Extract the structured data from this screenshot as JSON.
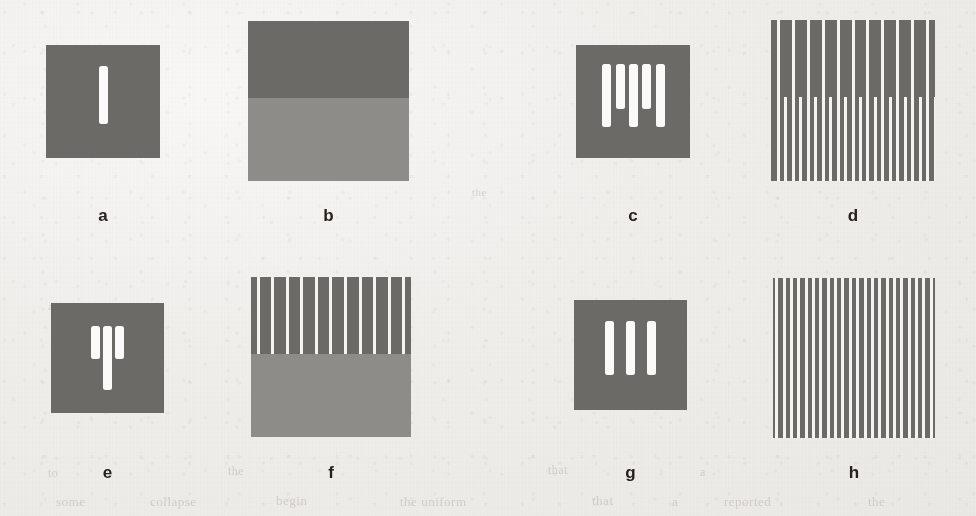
{
  "figure": {
    "caption_letters": [
      "a",
      "b",
      "c",
      "d",
      "e",
      "f",
      "g",
      "h"
    ],
    "background_color": "#f1f0ed",
    "dark_gray": "#6c6a67",
    "mid_gray": "#8e8c88",
    "line_white": "#f6f4f1",
    "label_color": "#26211d"
  },
  "panels": [
    {
      "id": "a",
      "label": "a",
      "type": "single-bar",
      "x": 46,
      "y": 45,
      "w": 114,
      "h": 113,
      "fill": "#6c6a67",
      "bars": [
        {
          "cx_pct": 50,
          "top_pct": 19,
          "h_pct": 51,
          "w": 9
        }
      ],
      "label_x": 46,
      "label_y": 206,
      "label_w": 114
    },
    {
      "id": "b",
      "label": "b",
      "type": "two-tone-field",
      "x": 248,
      "y": 21,
      "w": 161,
      "h": 160,
      "top_fill": "#6c6a67",
      "bottom_fill": "#8e8c88",
      "split_pct": 48,
      "label_x": 248,
      "label_y": 206,
      "label_w": 161
    },
    {
      "id": "c",
      "label": "c",
      "type": "bar-group",
      "x": 576,
      "y": 45,
      "w": 114,
      "h": 113,
      "fill": "#6c6a67",
      "bars": [
        {
          "cx_pct": 27,
          "top_pct": 17,
          "h_pct": 56,
          "w": 9
        },
        {
          "cx_pct": 39,
          "top_pct": 17,
          "h_pct": 40,
          "w": 9
        },
        {
          "cx_pct": 50,
          "top_pct": 17,
          "h_pct": 56,
          "w": 9
        },
        {
          "cx_pct": 62,
          "top_pct": 17,
          "h_pct": 40,
          "w": 9
        },
        {
          "cx_pct": 74,
          "top_pct": 17,
          "h_pct": 56,
          "w": 9
        }
      ],
      "label_x": 576,
      "label_y": 206,
      "label_w": 114
    },
    {
      "id": "d",
      "label": "d",
      "type": "grating-split-frequency",
      "x": 771,
      "y": 20,
      "w": 164,
      "h": 161,
      "fill": "#6c6a67",
      "full_lines": 11,
      "extra_lines": 11,
      "line_width": 3,
      "split_pct": 48,
      "label_x": 771,
      "label_y": 206,
      "label_w": 164
    },
    {
      "id": "e",
      "label": "e",
      "type": "bar-group",
      "x": 51,
      "y": 303,
      "w": 113,
      "h": 110,
      "fill": "#6c6a67",
      "bars": [
        {
          "cx_pct": 39,
          "top_pct": 21,
          "h_pct": 30,
          "w": 9
        },
        {
          "cx_pct": 50,
          "top_pct": 21,
          "h_pct": 58,
          "w": 9
        },
        {
          "cx_pct": 61,
          "top_pct": 21,
          "h_pct": 30,
          "w": 9
        }
      ],
      "label_x": 51,
      "label_y": 463,
      "label_w": 113
    },
    {
      "id": "f",
      "label": "f",
      "type": "grating-over-field",
      "x": 251,
      "y": 277,
      "w": 160,
      "h": 160,
      "top_fill": "#6c6a67",
      "bottom_fill": "#8e8c88",
      "lines": 11,
      "line_width": 3,
      "split_pct": 48,
      "label_x": 251,
      "label_y": 463,
      "label_w": 160
    },
    {
      "id": "g",
      "label": "g",
      "type": "bar-group",
      "x": 574,
      "y": 300,
      "w": 113,
      "h": 110,
      "fill": "#6c6a67",
      "bars": [
        {
          "cx_pct": 31,
          "top_pct": 19,
          "h_pct": 49,
          "w": 9
        },
        {
          "cx_pct": 50,
          "top_pct": 19,
          "h_pct": 49,
          "w": 9
        },
        {
          "cx_pct": 69,
          "top_pct": 19,
          "h_pct": 49,
          "w": 9
        }
      ],
      "label_x": 574,
      "label_y": 463,
      "label_w": 113
    },
    {
      "id": "h",
      "label": "h",
      "type": "grating-dense",
      "x": 773,
      "y": 278,
      "w": 162,
      "h": 160,
      "fill": "#6c6a67",
      "lines": 22,
      "line_width": 3,
      "label_x": 773,
      "label_y": 463,
      "label_w": 162
    }
  ],
  "bleed_text": [
    {
      "text": "to",
      "x": 48,
      "y": 466,
      "size": 12
    },
    {
      "text": "the",
      "x": 228,
      "y": 464,
      "size": 12
    },
    {
      "text": "that",
      "x": 548,
      "y": 463,
      "size": 12
    },
    {
      "text": "a",
      "x": 700,
      "y": 465,
      "size": 12
    },
    {
      "text": "some",
      "x": 56,
      "y": 494,
      "size": 13
    },
    {
      "text": "collapse",
      "x": 150,
      "y": 494,
      "size": 13
    },
    {
      "text": "begin",
      "x": 276,
      "y": 493,
      "size": 13
    },
    {
      "text": "the uniform",
      "x": 400,
      "y": 494,
      "size": 13
    },
    {
      "text": "that",
      "x": 592,
      "y": 493,
      "size": 13
    },
    {
      "text": "a",
      "x": 672,
      "y": 494,
      "size": 13
    },
    {
      "text": "reported",
      "x": 724,
      "y": 494,
      "size": 13
    },
    {
      "text": "the",
      "x": 868,
      "y": 494,
      "size": 13
    },
    {
      "text": "a",
      "x": 48,
      "y": 300,
      "size": 11
    },
    {
      "text": "the",
      "x": 472,
      "y": 186,
      "size": 11
    }
  ]
}
